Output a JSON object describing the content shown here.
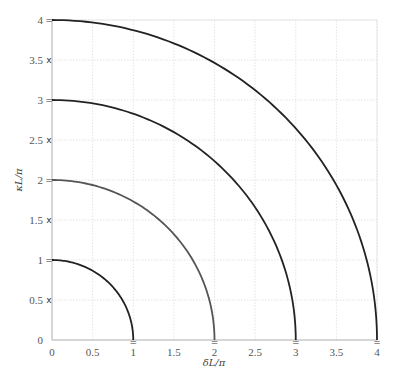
{
  "chart_data": {
    "type": "line",
    "title": "",
    "xlabel": "δL/π",
    "ylabel": "κL/π",
    "xlim": [
      0,
      4
    ],
    "ylim": [
      0,
      4
    ],
    "grid": true,
    "legend": null,
    "xticks": [
      "0",
      "0.5",
      "1",
      "1.5",
      "2",
      "2.5",
      "3",
      "3.5",
      "4"
    ],
    "yticks": [
      "0",
      "0.5",
      "1",
      "1.5",
      "2",
      "2.5",
      "3",
      "3.5",
      "4"
    ],
    "series": [
      {
        "name": "r=1",
        "shape": "quarter-circle",
        "radius": 1,
        "color": "#222222"
      },
      {
        "name": "r=2",
        "shape": "quarter-circle",
        "radius": 2,
        "color": "#555555"
      },
      {
        "name": "r=3",
        "shape": "quarter-circle",
        "radius": 3,
        "color": "#222222"
      },
      {
        "name": "r=4",
        "shape": "quarter-circle",
        "radius": 4,
        "color": "#222222"
      }
    ],
    "annotations": {
      "y_axis_markers": [
        {
          "y": 0.5,
          "symbol": "x"
        },
        {
          "y": 1,
          "symbol": "="
        },
        {
          "y": 1.5,
          "symbol": "x"
        },
        {
          "y": 2,
          "symbol": "="
        },
        {
          "y": 2.5,
          "symbol": "x"
        },
        {
          "y": 3,
          "symbol": "="
        },
        {
          "y": 3.5,
          "symbol": "x"
        },
        {
          "y": 4,
          "symbol": "="
        }
      ],
      "x_axis_markers": [
        {
          "x": 1,
          "symbol": "="
        },
        {
          "x": 2,
          "symbol": "="
        },
        {
          "x": 3,
          "symbol": "="
        },
        {
          "x": 4,
          "symbol": "="
        }
      ]
    }
  },
  "caption": "Figure 2.3: ..."
}
